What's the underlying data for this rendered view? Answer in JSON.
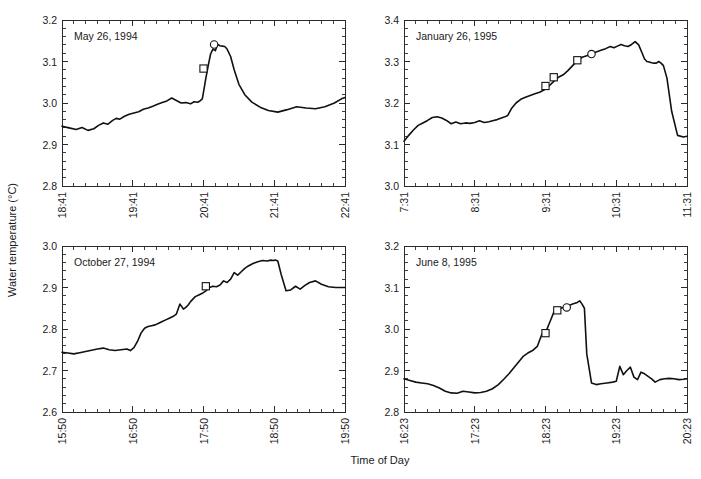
{
  "figure": {
    "width": 701,
    "height": 479,
    "background": "#ffffff",
    "line_color": "#111111",
    "axis_color": "#2b2b2b",
    "xlabel": "Time of Day",
    "ylabel": "Water temperature (°C)"
  },
  "chart_data": [
    {
      "type": "line",
      "panel": "top-left",
      "title": "May 26, 1994",
      "xlabel": "Time of Day",
      "ylabel": "Water temperature (°C)",
      "grid": false,
      "legend": "none",
      "ylim": [
        2.8,
        3.2
      ],
      "ytick_labels": [
        "2.8",
        "2.9",
        "3.0",
        "3.1",
        "3.2"
      ],
      "ytick_values": [
        2.8,
        2.9,
        3.0,
        3.1,
        3.2
      ],
      "y_minor_per_interval": 5,
      "xlim_minutes": [
        1121,
        1361
      ],
      "xtick_labels": [
        "18:41",
        "19:41",
        "20:41",
        "21:41",
        "22:41"
      ],
      "xtick_minutes": [
        1121,
        1181,
        1241,
        1301,
        1361
      ],
      "x_minor_per_interval": 6,
      "x": [
        1121,
        1127,
        1133,
        1138,
        1143,
        1148,
        1152,
        1156,
        1160,
        1164,
        1167,
        1170,
        1174,
        1178,
        1182,
        1186,
        1190,
        1194,
        1198,
        1202,
        1206,
        1210,
        1214,
        1218,
        1222,
        1226,
        1230,
        1233,
        1236,
        1238,
        1240,
        1241,
        1243,
        1245,
        1247,
        1249,
        1251,
        1253,
        1255,
        1257,
        1259,
        1261,
        1264,
        1267,
        1271,
        1276,
        1282,
        1289,
        1296,
        1304,
        1312,
        1320,
        1328,
        1336,
        1344,
        1352,
        1358,
        1361
      ],
      "y": [
        2.944,
        2.94,
        2.936,
        2.941,
        2.934,
        2.938,
        2.946,
        2.952,
        2.949,
        2.958,
        2.963,
        2.961,
        2.968,
        2.973,
        2.976,
        2.979,
        2.985,
        2.988,
        2.992,
        2.997,
        3.001,
        3.005,
        3.012,
        3.006,
        3.0,
        3.001,
        2.998,
        3.003,
        3.002,
        3.005,
        3.01,
        3.026,
        3.06,
        3.09,
        3.118,
        3.13,
        3.126,
        3.141,
        3.138,
        3.137,
        3.136,
        3.13,
        3.112,
        3.08,
        3.045,
        3.02,
        3.002,
        2.99,
        2.982,
        2.978,
        2.984,
        2.991,
        2.988,
        2.986,
        2.991,
        3.0,
        3.01,
        3.013
      ],
      "markers": [
        {
          "shape": "square",
          "x": 1241,
          "y": 3.083
        },
        {
          "shape": "circle",
          "x": 1250,
          "y": 3.141
        }
      ]
    },
    {
      "type": "line",
      "panel": "top-right",
      "title": "January 26, 1995",
      "xlabel": "Time of Day",
      "ylabel": "Water temperature (°C)",
      "grid": false,
      "legend": "none",
      "ylim": [
        3.0,
        3.4
      ],
      "ytick_labels": [
        "3.0",
        "3.1",
        "3.2",
        "3.3",
        "3.4"
      ],
      "ytick_values": [
        3.0,
        3.1,
        3.2,
        3.3,
        3.4
      ],
      "y_minor_per_interval": 5,
      "xlim_minutes": [
        451,
        691
      ],
      "xtick_labels": [
        "7:31",
        "8:31",
        "9:31",
        "10:31",
        "11:31"
      ],
      "xtick_minutes": [
        451,
        511,
        571,
        631,
        691
      ],
      "x_minor_per_interval": 6,
      "x": [
        451,
        455,
        459,
        463,
        467,
        471,
        475,
        479,
        483,
        487,
        491,
        495,
        499,
        503,
        507,
        511,
        515,
        519,
        523,
        527,
        530,
        533,
        536,
        539,
        542,
        546,
        550,
        554,
        558,
        562,
        566,
        570,
        574,
        578,
        582,
        586,
        590,
        594,
        598,
        602,
        606,
        610,
        614,
        618,
        622,
        626,
        629,
        632,
        635,
        638,
        641,
        644,
        647,
        650,
        653,
        655,
        657,
        659,
        661,
        663,
        665,
        667,
        669,
        671,
        674,
        678,
        683,
        688,
        691
      ],
      "y": [
        3.108,
        3.122,
        3.135,
        3.146,
        3.152,
        3.158,
        3.165,
        3.167,
        3.164,
        3.158,
        3.15,
        3.154,
        3.15,
        3.152,
        3.151,
        3.153,
        3.157,
        3.153,
        3.155,
        3.158,
        3.16,
        3.163,
        3.166,
        3.17,
        3.186,
        3.2,
        3.209,
        3.214,
        3.218,
        3.222,
        3.226,
        3.232,
        3.241,
        3.252,
        3.262,
        3.268,
        3.278,
        3.29,
        3.302,
        3.31,
        3.314,
        3.318,
        3.323,
        3.327,
        3.331,
        3.336,
        3.333,
        3.337,
        3.341,
        3.338,
        3.336,
        3.341,
        3.348,
        3.34,
        3.32,
        3.306,
        3.3,
        3.299,
        3.297,
        3.296,
        3.296,
        3.3,
        3.296,
        3.29,
        3.26,
        3.18,
        3.122,
        3.118,
        3.12
      ],
      "markers": [
        {
          "shape": "square",
          "x": 571,
          "y": 3.241
        },
        {
          "shape": "square",
          "x": 578,
          "y": 3.262
        },
        {
          "shape": "square",
          "x": 598,
          "y": 3.303
        },
        {
          "shape": "circle",
          "x": 610,
          "y": 3.318
        }
      ]
    },
    {
      "type": "line",
      "panel": "bottom-left",
      "title": "October 27, 1994",
      "xlabel": "Time of Day",
      "ylabel": "Water temperature (°C)",
      "grid": false,
      "legend": "none",
      "ylim": [
        2.6,
        3.0
      ],
      "ytick_labels": [
        "2.6",
        "2.7",
        "2.8",
        "2.9",
        "3.0"
      ],
      "ytick_values": [
        2.6,
        2.7,
        2.8,
        2.9,
        3.0
      ],
      "y_minor_per_interval": 5,
      "xlim_minutes": [
        950,
        1190
      ],
      "xtick_labels": [
        "15:50",
        "16:50",
        "17:50",
        "18:50",
        "19:50"
      ],
      "xtick_minutes": [
        950,
        1010,
        1070,
        1130,
        1190
      ],
      "x_minor_per_interval": 6,
      "x": [
        950,
        955,
        960,
        965,
        970,
        975,
        980,
        985,
        990,
        995,
        1000,
        1005,
        1008,
        1011,
        1014,
        1017,
        1020,
        1023,
        1026,
        1029,
        1032,
        1035,
        1038,
        1041,
        1044,
        1047,
        1050,
        1053,
        1055,
        1057,
        1059,
        1061,
        1063,
        1066,
        1069,
        1072,
        1075,
        1078,
        1081,
        1084,
        1087,
        1090,
        1093,
        1096,
        1099,
        1102,
        1105,
        1108,
        1112,
        1116,
        1120,
        1124,
        1127,
        1129,
        1131,
        1133,
        1136,
        1140,
        1144,
        1148,
        1152,
        1156,
        1160,
        1165,
        1170,
        1176,
        1182,
        1190
      ],
      "y": [
        2.744,
        2.742,
        2.74,
        2.743,
        2.746,
        2.749,
        2.752,
        2.754,
        2.75,
        2.748,
        2.75,
        2.752,
        2.748,
        2.755,
        2.77,
        2.79,
        2.802,
        2.806,
        2.808,
        2.81,
        2.814,
        2.818,
        2.822,
        2.826,
        2.83,
        2.836,
        2.86,
        2.848,
        2.852,
        2.858,
        2.866,
        2.872,
        2.878,
        2.882,
        2.886,
        2.892,
        2.9,
        2.903,
        2.902,
        2.906,
        2.916,
        2.912,
        2.92,
        2.936,
        2.93,
        2.938,
        2.946,
        2.952,
        2.958,
        2.962,
        2.965,
        2.964,
        2.966,
        2.965,
        2.966,
        2.964,
        2.93,
        2.892,
        2.894,
        2.903,
        2.896,
        2.905,
        2.912,
        2.916,
        2.908,
        2.902,
        2.9,
        2.9
      ],
      "markers": [
        {
          "shape": "square",
          "x": 1072,
          "y": 2.903
        }
      ]
    },
    {
      "type": "line",
      "panel": "bottom-right",
      "title": "June 8, 1995",
      "xlabel": "Time of Day",
      "ylabel": "Water temperature (°C)",
      "grid": false,
      "legend": "none",
      "ylim": [
        2.8,
        3.2
      ],
      "ytick_labels": [
        "2.8",
        "2.9",
        "3.0",
        "3.1",
        "3.2"
      ],
      "ytick_values": [
        2.8,
        2.9,
        3.0,
        3.1,
        3.2
      ],
      "y_minor_per_interval": 5,
      "xlim_minutes": [
        983,
        1223
      ],
      "xtick_labels": [
        "16:23",
        "17:23",
        "18:23",
        "19:23",
        "20:23"
      ],
      "xtick_minutes": [
        983,
        1043,
        1103,
        1163,
        1223
      ],
      "x_minor_per_interval": 6,
      "x": [
        983,
        988,
        993,
        998,
        1003,
        1008,
        1013,
        1018,
        1023,
        1028,
        1033,
        1038,
        1043,
        1048,
        1053,
        1058,
        1063,
        1068,
        1072,
        1076,
        1080,
        1084,
        1088,
        1092,
        1096,
        1100,
        1102,
        1104,
        1106,
        1108,
        1110,
        1112,
        1114,
        1116,
        1118,
        1120,
        1122,
        1124,
        1126,
        1128,
        1130,
        1132,
        1134,
        1136,
        1138,
        1142,
        1146,
        1150,
        1155,
        1160,
        1163,
        1166,
        1169,
        1172,
        1175,
        1178,
        1181,
        1184,
        1187,
        1190,
        1193,
        1196,
        1200,
        1204,
        1208,
        1212,
        1216,
        1220,
        1223
      ],
      "y": [
        2.88,
        2.876,
        2.872,
        2.87,
        2.868,
        2.864,
        2.858,
        2.85,
        2.846,
        2.845,
        2.85,
        2.848,
        2.846,
        2.847,
        2.85,
        2.856,
        2.866,
        2.88,
        2.892,
        2.906,
        2.92,
        2.934,
        2.942,
        2.948,
        2.958,
        2.988,
        2.992,
        2.998,
        3.012,
        3.026,
        3.04,
        3.046,
        3.048,
        3.05,
        3.052,
        3.054,
        3.056,
        3.058,
        3.06,
        3.062,
        3.064,
        3.068,
        3.06,
        3.05,
        2.94,
        2.87,
        2.866,
        2.868,
        2.87,
        2.872,
        2.874,
        2.91,
        2.89,
        2.9,
        2.908,
        2.884,
        2.878,
        2.896,
        2.892,
        2.886,
        2.88,
        2.872,
        2.878,
        2.88,
        2.881,
        2.88,
        2.878,
        2.879,
        2.88
      ],
      "markers": [
        {
          "shape": "square",
          "x": 1103,
          "y": 2.99
        },
        {
          "shape": "square",
          "x": 1113,
          "y": 3.045
        },
        {
          "shape": "circle",
          "x": 1121,
          "y": 3.052
        }
      ]
    }
  ]
}
